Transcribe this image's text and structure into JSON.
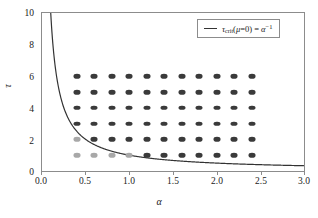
{
  "chart_data": {
    "type": "scatter",
    "title": "",
    "xlabel": "α",
    "ylabel": "τ",
    "xlim": [
      0.0,
      3.0
    ],
    "ylim": [
      0.0,
      10.0
    ],
    "grid": false,
    "legend_position": "top-right",
    "xticks": [
      "0.0",
      "0.5",
      "1.0",
      "1.5",
      "2.0",
      "2.5",
      "3.0"
    ],
    "xtick_values": [
      0.0,
      0.5,
      1.0,
      1.5,
      2.0,
      2.5,
      3.0
    ],
    "yticks": [
      "0",
      "2",
      "4",
      "6",
      "8",
      "10"
    ],
    "ytick_values": [
      0,
      2,
      4,
      6,
      8,
      10
    ],
    "legend": [
      {
        "label": "τ_crit(μ=0) = α^-1",
        "marker": "line",
        "color": "#333333"
      }
    ],
    "series": [
      {
        "name": "stable-grid-points",
        "type": "scatter",
        "color": "#3a3a3a",
        "marker": "ellipse",
        "points": [
          [
            0.4,
            3
          ],
          [
            0.6,
            3
          ],
          [
            0.8,
            3
          ],
          [
            1.0,
            3
          ],
          [
            1.2,
            3
          ],
          [
            1.4,
            3
          ],
          [
            1.6,
            3
          ],
          [
            1.8,
            3
          ],
          [
            2.0,
            3
          ],
          [
            2.2,
            3
          ],
          [
            2.4,
            3
          ],
          [
            0.4,
            4
          ],
          [
            0.6,
            4
          ],
          [
            0.8,
            4
          ],
          [
            1.0,
            4
          ],
          [
            1.2,
            4
          ],
          [
            1.4,
            4
          ],
          [
            1.6,
            4
          ],
          [
            1.8,
            4
          ],
          [
            2.0,
            4
          ],
          [
            2.2,
            4
          ],
          [
            2.4,
            4
          ],
          [
            0.4,
            5
          ],
          [
            0.6,
            5
          ],
          [
            0.8,
            5
          ],
          [
            1.0,
            5
          ],
          [
            1.2,
            5
          ],
          [
            1.4,
            5
          ],
          [
            1.6,
            5
          ],
          [
            1.8,
            5
          ],
          [
            2.0,
            5
          ],
          [
            2.2,
            5
          ],
          [
            2.4,
            5
          ],
          [
            0.4,
            6
          ],
          [
            0.6,
            6
          ],
          [
            0.8,
            6
          ],
          [
            1.0,
            6
          ],
          [
            1.2,
            6
          ],
          [
            1.4,
            6
          ],
          [
            1.6,
            6
          ],
          [
            1.8,
            6
          ],
          [
            2.0,
            6
          ],
          [
            2.2,
            6
          ],
          [
            2.4,
            6
          ],
          [
            0.6,
            2
          ],
          [
            0.8,
            2
          ],
          [
            1.0,
            2
          ],
          [
            1.2,
            2
          ],
          [
            1.4,
            2
          ],
          [
            1.6,
            2
          ],
          [
            1.8,
            2
          ],
          [
            2.0,
            2
          ],
          [
            2.2,
            2
          ],
          [
            2.4,
            2
          ],
          [
            1.2,
            1
          ],
          [
            1.4,
            1
          ],
          [
            1.6,
            1
          ],
          [
            1.8,
            1
          ],
          [
            2.0,
            1
          ],
          [
            2.2,
            1
          ],
          [
            2.4,
            1
          ]
        ]
      },
      {
        "name": "unstable-grid-points",
        "type": "scatter",
        "color": "#a8a8a8",
        "marker": "ellipse",
        "points": [
          [
            0.4,
            2
          ],
          [
            0.4,
            1
          ],
          [
            0.6,
            1
          ],
          [
            0.8,
            1
          ],
          [
            1.0,
            1
          ]
        ]
      },
      {
        "name": "tau-crit-curve",
        "type": "line",
        "color": "#333333",
        "formula": "tau = 1/alpha",
        "x_range": [
          0.1,
          3.0
        ]
      }
    ]
  },
  "axes": {
    "y_title": "τ",
    "x_title": "α",
    "ytick_labels": [
      "0",
      "2",
      "4",
      "6",
      "8",
      "10"
    ],
    "xtick_labels": [
      "0.0",
      "0.5",
      "1.0",
      "1.5",
      "2.0",
      "2.5",
      "3.0"
    ]
  },
  "legend": {
    "tau_symbol": "τ",
    "crit_subscript": "crit",
    "open_paren": "(",
    "mu_symbol": "μ",
    "equals_zero": "=0",
    "close_paren": ")",
    "equals": "=",
    "alpha_symbol": "α",
    "exponent": "−1"
  }
}
